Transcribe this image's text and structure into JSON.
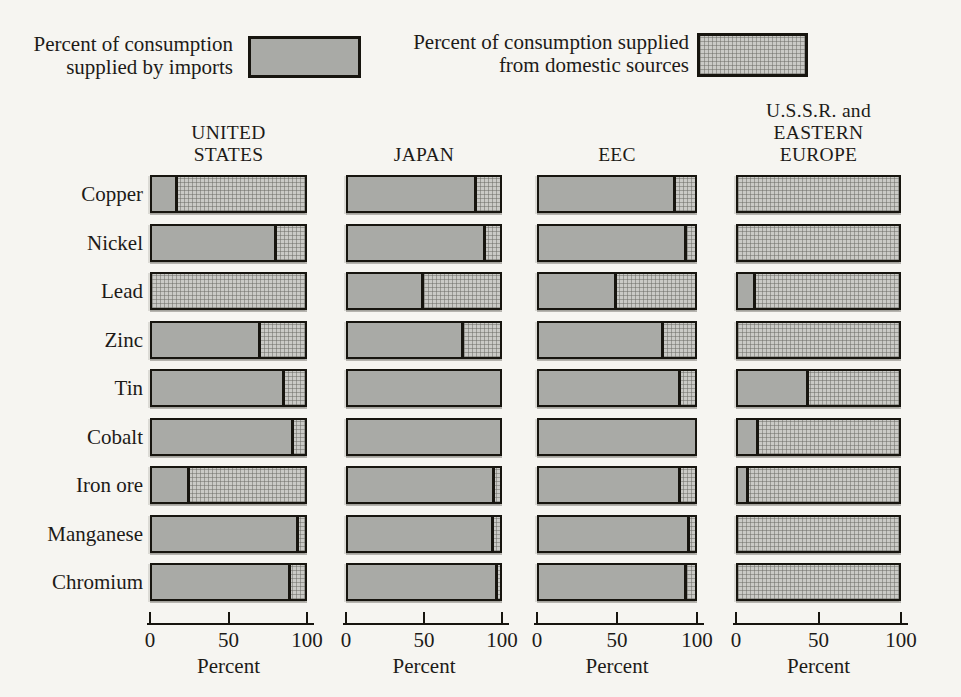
{
  "figure": {
    "legend": {
      "imports_label": "Percent of consumption\nsupplied by imports",
      "domestic_label": "Percent of consumption supplied\nfrom domestic sources"
    },
    "colors": {
      "imports_fill": "#a9aaa6",
      "domestic_fill": "#cacac6",
      "outline": "#17150f",
      "text": "#1d1b18",
      "background": "#f6f5f1"
    }
  },
  "chart_data": {
    "type": "bar",
    "orientation": "horizontal",
    "stacking": "percent",
    "categories": [
      "Copper",
      "Nickel",
      "Lead",
      "Zinc",
      "Tin",
      "Cobalt",
      "Iron ore",
      "Manganese",
      "Chromium"
    ],
    "series": [
      {
        "name": "UNITED STATES",
        "header": "UNITED\nSTATES",
        "imports_pct": [
          17,
          82,
          0,
          71,
          87,
          93,
          25,
          96,
          91
        ],
        "domestic_pct": [
          83,
          18,
          100,
          29,
          13,
          7,
          75,
          4,
          9
        ]
      },
      {
        "name": "JAPAN",
        "header": "JAPAN",
        "imports_pct": [
          85,
          91,
          50,
          76,
          100,
          100,
          97,
          96,
          99
        ],
        "domestic_pct": [
          15,
          9,
          50,
          24,
          0,
          0,
          3,
          4,
          1
        ]
      },
      {
        "name": "EEC",
        "header": "EEC",
        "imports_pct": [
          88,
          95,
          50,
          80,
          91,
          100,
          91,
          97,
          95
        ],
        "domestic_pct": [
          12,
          5,
          50,
          20,
          9,
          0,
          9,
          3,
          5
        ]
      },
      {
        "name": "U.S.S.R. and EASTERN EUROPE",
        "header": "U.S.S.R. and\nEASTERN\nEUROPE",
        "imports_pct": [
          0,
          0,
          11,
          0,
          44,
          13,
          7,
          0,
          0
        ],
        "domestic_pct": [
          100,
          100,
          89,
          100,
          56,
          87,
          93,
          100,
          100
        ]
      }
    ],
    "x_ticks": [
      0,
      50,
      100
    ],
    "xlim": [
      0,
      100
    ],
    "xlabel": "Percent",
    "legend_position": "top",
    "grid": false
  }
}
